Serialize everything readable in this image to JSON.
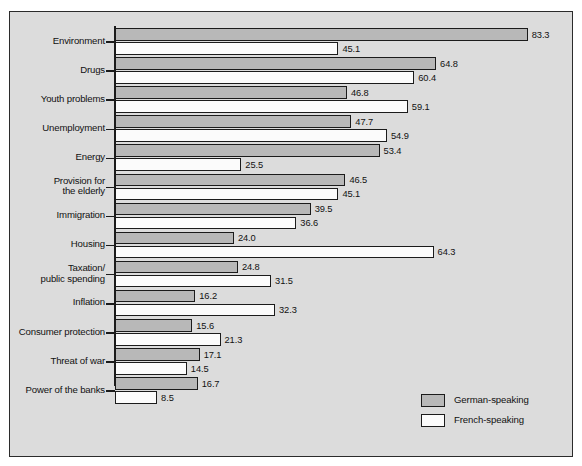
{
  "chart_data": {
    "type": "bar",
    "orientation": "horizontal",
    "title": "",
    "subtitle": "",
    "xlabel": "",
    "ylabel": "",
    "xlim": [
      0,
      90
    ],
    "grid": false,
    "legend_position": "bottom-right",
    "value_label_format": "one-decimal",
    "categories": [
      "Environment",
      "Drugs",
      "Youth problems",
      "Unemployment",
      "Energy",
      "Provision for\nthe elderly",
      "Immigration",
      "Housing",
      "Taxation/\npublic spending",
      "Inflation",
      "Consumer protection",
      "Threat of war",
      "Power of the banks"
    ],
    "series": [
      {
        "name": "German-speaking",
        "color": "#b8b8b8",
        "values": [
          83.3,
          64.8,
          46.8,
          47.7,
          53.4,
          46.5,
          39.5,
          24.0,
          24.8,
          16.2,
          15.6,
          17.1,
          16.7
        ]
      },
      {
        "name": "French-speaking",
        "color": "#fbfbfb",
        "values": [
          45.1,
          60.4,
          59.1,
          54.9,
          25.5,
          45.1,
          36.6,
          64.3,
          31.5,
          32.3,
          21.3,
          14.5,
          8.5
        ]
      }
    ]
  },
  "legend": {
    "items": [
      {
        "label": "German-speaking",
        "swatch": "german"
      },
      {
        "label": "French-speaking",
        "swatch": "french"
      }
    ]
  }
}
